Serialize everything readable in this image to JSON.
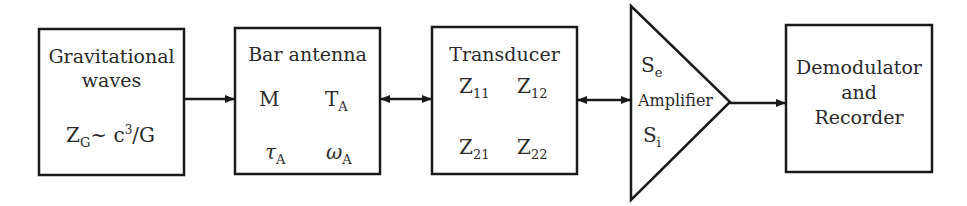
{
  "diagram": {
    "stroke_color": "#1a1a1a",
    "blocks": [
      {
        "id": "gravitational-waves",
        "label_line1": "Gravitational",
        "label_line2": "waves",
        "formula": {
          "base": "Z",
          "sub": "G",
          "rest": "~ c",
          "sup": "3",
          "tail": "/G"
        }
      },
      {
        "id": "bar-antenna",
        "label": "Bar antenna",
        "params": [
          {
            "base": "M",
            "sub": ""
          },
          {
            "base": "T",
            "sub": "A"
          },
          {
            "base": "τ",
            "sub": "A"
          },
          {
            "base": "ω",
            "sub": "A"
          }
        ]
      },
      {
        "id": "transducer",
        "label": "Transducer",
        "params": [
          {
            "base": "Z",
            "sub": "11"
          },
          {
            "base": "Z",
            "sub": "12"
          },
          {
            "base": "Z",
            "sub": "21"
          },
          {
            "base": "Z",
            "sub": "22"
          }
        ]
      },
      {
        "id": "amplifier",
        "label": "Amplifier",
        "params": [
          {
            "base": "S",
            "sub": "e"
          },
          {
            "base": "S",
            "sub": "i"
          }
        ]
      },
      {
        "id": "demodulator-recorder",
        "label_line1": "Demodulator",
        "label_line2": "and",
        "label_line3": "Recorder"
      }
    ],
    "connections": [
      {
        "from": "gravitational-waves",
        "to": "bar-antenna",
        "type": "one-way"
      },
      {
        "from": "bar-antenna",
        "to": "transducer",
        "type": "two-way"
      },
      {
        "from": "transducer",
        "to": "amplifier",
        "type": "two-way"
      },
      {
        "from": "amplifier",
        "to": "demodulator-recorder",
        "type": "one-way"
      }
    ]
  }
}
